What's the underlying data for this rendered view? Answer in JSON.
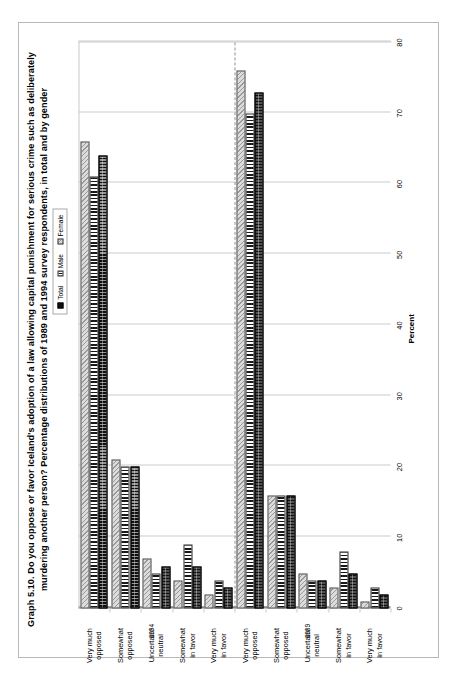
{
  "figure": {
    "xaxis_title": "Percent",
    "group_labels": {
      "first": "1989",
      "second": "1994"
    }
  },
  "legend": {
    "items": [
      {
        "label": "Total",
        "key": "total"
      },
      {
        "label": "Male",
        "key": "male"
      },
      {
        "label": "Female",
        "key": "female"
      }
    ]
  },
  "axis": {
    "ticks": [
      "0",
      "10",
      "20",
      "30",
      "40",
      "50",
      "60",
      "70",
      "80"
    ],
    "min": 0,
    "max": 80
  },
  "chart_data": {
    "type": "bar",
    "orientation": "horizontal",
    "xlabel": "Percent",
    "ylabel": "",
    "xlim": [
      0,
      80
    ],
    "grid": true,
    "legend_position": "top-center",
    "categories": [
      "Very much opposed",
      "Somewhat opposed",
      "Uncertain/ neutral",
      "Somewhat in favor",
      "Very much in favor"
    ],
    "groups": [
      {
        "name": "1989",
        "series": [
          {
            "name": "Total",
            "values": [
              64,
              20,
              6,
              6,
              3
            ]
          },
          {
            "name": "Male",
            "values": [
              61,
              20,
              5,
              9,
              4
            ]
          },
          {
            "name": "Female",
            "values": [
              66,
              21,
              7,
              4,
              2
            ]
          }
        ]
      },
      {
        "name": "1994",
        "series": [
          {
            "name": "Total",
            "values": [
              73,
              16,
              4,
              5,
              2
            ]
          },
          {
            "name": "Male",
            "values": [
              70,
              16,
              4,
              8,
              3
            ]
          },
          {
            "name": "Female",
            "values": [
              76,
              16,
              5,
              3,
              1
            ]
          }
        ]
      }
    ]
  }
}
